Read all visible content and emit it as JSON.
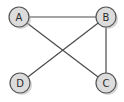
{
  "diagram": {
    "type": "undirected-graph",
    "colors": {
      "background": "#ffffff",
      "node_fill": "#dcdcdc",
      "node_stroke": "#555555",
      "edge": "#4a4a4a",
      "label": "#2a2a2a"
    },
    "nodes": [
      {
        "id": "A",
        "label": "A",
        "x": 19,
        "y": 17
      },
      {
        "id": "B",
        "label": "B",
        "x": 106,
        "y": 17
      },
      {
        "id": "C",
        "label": "C",
        "x": 106,
        "y": 83
      },
      {
        "id": "D",
        "label": "D",
        "x": 20,
        "y": 83
      }
    ],
    "edges": [
      {
        "from": "A",
        "to": "B"
      },
      {
        "from": "A",
        "to": "C"
      },
      {
        "from": "B",
        "to": "C"
      },
      {
        "from": "B",
        "to": "D"
      }
    ]
  }
}
